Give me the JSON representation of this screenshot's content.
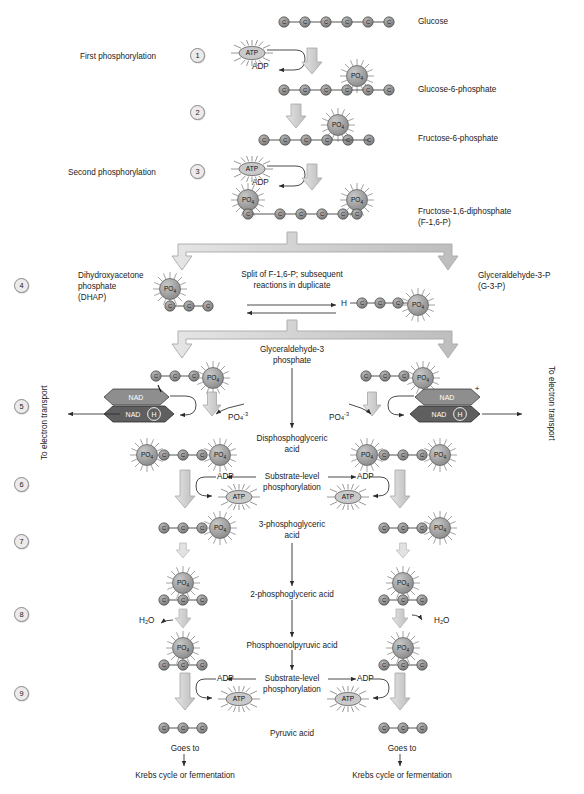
{
  "colors": {
    "carbon_fill": "#8f8f8f",
    "po4_fill": "#a8a8a8",
    "atp_fill": "#c9c9c9",
    "nad_fill": "#8e8e8e",
    "nadh_fill": "#5f5f5f",
    "arrow_fill": "#d4d4d4",
    "arrow_stroke": "#a0a0a0",
    "text": "#1b1b1b",
    "line": "#3a3a3a"
  },
  "steps": [
    {
      "n": "1",
      "x": 196,
      "y": 54
    },
    {
      "n": "2",
      "x": 196,
      "y": 111
    },
    {
      "n": "3",
      "x": 196,
      "y": 170
    },
    {
      "n": "4",
      "x": 20,
      "y": 284
    },
    {
      "n": "5",
      "x": 20,
      "y": 405
    },
    {
      "n": "6",
      "x": 20,
      "y": 483
    },
    {
      "n": "7",
      "x": 20,
      "y": 540
    },
    {
      "n": "8",
      "x": 20,
      "y": 613
    },
    {
      "n": "9",
      "x": 20,
      "y": 692
    }
  ],
  "step_labels": [
    {
      "text": "First phosphorylation",
      "x": 80,
      "y": 57
    },
    {
      "text": "Second phosphorylation",
      "x": 68,
      "y": 173
    }
  ],
  "compound_labels": [
    {
      "text": "Glucose",
      "x": 418,
      "y": 21
    },
    {
      "text": "Glucose-6-phosphate",
      "x": 418,
      "y": 89
    },
    {
      "text": "Fructose-6-phosphate",
      "x": 418,
      "y": 138
    },
    {
      "text": "Fructose-1,6-diphosphate",
      "x": 418,
      "y": 211
    },
    {
      "text": "(F-1,6-P)",
      "x": 418,
      "y": 221
    }
  ],
  "left_labels": [
    {
      "text": "Dihydroxyacetone",
      "x": 78,
      "y": 275
    },
    {
      "text": "phosphate",
      "x": 78,
      "y": 285
    },
    {
      "text": "(DHAP)",
      "x": 78,
      "y": 295
    }
  ],
  "right_labels": [
    {
      "text": "Glyceraldehyde-3-P",
      "x": 478,
      "y": 275
    },
    {
      "text": "(G-3-P)",
      "x": 478,
      "y": 285
    }
  ],
  "center_labels": [
    {
      "text": "Split of F-1,6-P; subsequent",
      "x": 292,
      "y": 274
    },
    {
      "text": "reactions in duplicate",
      "x": 292,
      "y": 284
    },
    {
      "text": "Glyceraldehyde-3",
      "x": 292,
      "y": 349
    },
    {
      "text": "phosphate",
      "x": 292,
      "y": 359
    },
    {
      "text": "Disphosphoglyceric",
      "x": 292,
      "y": 438
    },
    {
      "text": "acid",
      "x": 292,
      "y": 448
    },
    {
      "text": "Substrate-level",
      "x": 292,
      "y": 477
    },
    {
      "text": "phosphorylation",
      "x": 292,
      "y": 487
    },
    {
      "text": "3-phosphoglyceric",
      "x": 292,
      "y": 524
    },
    {
      "text": "acid",
      "x": 292,
      "y": 534
    },
    {
      "text": "2-phosphoglyceric acid",
      "x": 292,
      "y": 594
    },
    {
      "text": "Phosphoenolpyruvic acid",
      "x": 292,
      "y": 645
    },
    {
      "text": "Substrate-level",
      "x": 292,
      "y": 679
    },
    {
      "text": "phosphorylation",
      "x": 292,
      "y": 689
    },
    {
      "text": "Pyruvic acid",
      "x": 292,
      "y": 733
    }
  ],
  "electron_transport": [
    {
      "text": "To electron transport",
      "side": "left",
      "x": 38,
      "y": 452
    },
    {
      "text": "To electron transport",
      "side": "right",
      "x": 556,
      "y": 370
    }
  ],
  "small_labels": [
    {
      "text": "ADP",
      "x": 258,
      "y": 66
    },
    {
      "text": "ADP",
      "x": 258,
      "y": 182
    },
    {
      "text": "H",
      "x": 352,
      "y": 303
    },
    {
      "text": "ADP",
      "x": 227,
      "y": 477
    },
    {
      "text": "ADP",
      "x": 357,
      "y": 477
    },
    {
      "text": "ADP",
      "x": 227,
      "y": 679
    },
    {
      "text": "ADP",
      "x": 357,
      "y": 679
    },
    {
      "text": "H₂O",
      "x": 142,
      "y": 620
    },
    {
      "text": "H₂O",
      "x": 440,
      "y": 620
    }
  ],
  "phosphate_ion_labels": [
    {
      "text": "PO",
      "sub": "4",
      "sup": "-3",
      "x": 222,
      "y": 402
    },
    {
      "text": "PO",
      "sub": "4",
      "sup": "-3",
      "x": 338,
      "y": 402
    }
  ],
  "goes_to": [
    {
      "text": "Goes to",
      "x": 185,
      "y": 748
    },
    {
      "text": "Goes to",
      "x": 400,
      "y": 748
    },
    {
      "text": "Krebs cycle or fermentation",
      "x": 185,
      "y": 775
    },
    {
      "text": "Krebs cycle or fermentation",
      "x": 400,
      "y": 775
    }
  ],
  "molecules": {
    "atp_label": "ATP",
    "po4_label": "PO",
    "po4_sub": "4",
    "nad_label": "NAD",
    "nadh_label": "NAD",
    "nadh_h": "H",
    "nad_plus": "+",
    "carbon_label": "C"
  },
  "carbon_chains": [
    {
      "name": "glucose",
      "x": 284,
      "y": 22,
      "count": 6,
      "spacing": 21
    },
    {
      "name": "glucose-6-phosphate",
      "x": 284,
      "y": 90,
      "count": 6,
      "spacing": 21
    },
    {
      "name": "fructose-6-phosphate",
      "x": 264,
      "y": 140,
      "count": 6,
      "spacing": 21
    },
    {
      "name": "fructose-1,6-diphosphate",
      "x": 244,
      "y": 214,
      "count": 6,
      "spacing": 21
    },
    {
      "name": "dhap",
      "x": 170,
      "y": 306,
      "count": 3,
      "spacing": 19
    },
    {
      "name": "g3p",
      "x": 362,
      "y": 303,
      "count": 3,
      "spacing": 17
    },
    {
      "name": "g3p-left",
      "x": 170,
      "y": 376,
      "count": 3,
      "spacing": 19
    },
    {
      "name": "g3p-right",
      "x": 390,
      "y": 376,
      "count": 3,
      "spacing": 19
    },
    {
      "name": "dpg-left",
      "x": 164,
      "y": 455,
      "count": 3,
      "spacing": 19
    },
    {
      "name": "dpg-right",
      "x": 384,
      "y": 455,
      "count": 3,
      "spacing": 19
    },
    {
      "name": "3pg-left",
      "x": 164,
      "y": 528,
      "count": 3,
      "spacing": 19
    },
    {
      "name": "3pg-right",
      "x": 384,
      "y": 528,
      "count": 3,
      "spacing": 19
    },
    {
      "name": "2pg-left",
      "x": 164,
      "y": 600,
      "count": 3,
      "spacing": 19
    },
    {
      "name": "2pg-right",
      "x": 384,
      "y": 600,
      "count": 3,
      "spacing": 19
    },
    {
      "name": "pep-left",
      "x": 164,
      "y": 665,
      "count": 3,
      "spacing": 19
    },
    {
      "name": "pep-right",
      "x": 384,
      "y": 665,
      "count": 3,
      "spacing": 19
    },
    {
      "name": "pyruvate-left",
      "x": 164,
      "y": 728,
      "count": 3,
      "spacing": 19
    },
    {
      "name": "pyruvate-right",
      "x": 384,
      "y": 728,
      "count": 3,
      "spacing": 19
    }
  ]
}
